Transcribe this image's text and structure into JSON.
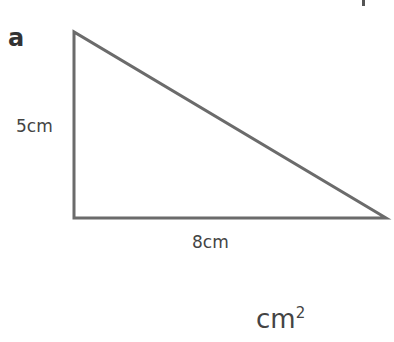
{
  "question": {
    "part_label": "a",
    "shape": "right-triangle",
    "height_label": "5cm",
    "base_label": "8cm",
    "answer_unit": "cm",
    "answer_unit_power": "2",
    "stroke_color": "#6b6b6b"
  }
}
